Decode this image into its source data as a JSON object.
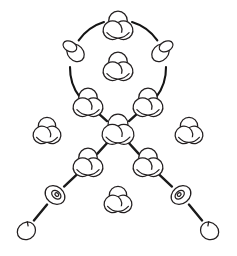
{
  "figure": {
    "background_color": "#ffffff",
    "stroke_color": "#231f20",
    "edge_color": "#1a1a1a",
    "width": 237,
    "height": 256
  },
  "legend": {
    "knot_types": [
      "trefoil",
      "twisted-loop",
      "coiled-loop",
      "unknot"
    ]
  },
  "chart_data": {
    "type": "diagram",
    "xlabel": "",
    "ylabel": "",
    "grid": false,
    "legend": "none",
    "xlim": [
      0,
      237
    ],
    "ylim": [
      0,
      256
    ],
    "nodes": [
      {
        "id": "n1",
        "label": "top",
        "knot": "trefoil",
        "x": 118,
        "y": 27,
        "r": 15,
        "on_circle": true,
        "angle_deg": 270
      },
      {
        "id": "n2",
        "label": "upper-right",
        "knot": "twisted-loop",
        "x": 163,
        "y": 50,
        "r": 14,
        "on_circle": true,
        "angle_deg": 342
      },
      {
        "id": "n3",
        "label": "upper-left",
        "knot": "twisted-loop",
        "x": 73,
        "y": 50,
        "r": 14,
        "on_circle": true,
        "angle_deg": 198
      },
      {
        "id": "n4",
        "label": "mid-left",
        "knot": "trefoil",
        "x": 88,
        "y": 104,
        "r": 15,
        "on_circle": true,
        "angle_deg": 126
      },
      {
        "id": "n5",
        "label": "mid-right",
        "knot": "trefoil",
        "x": 148,
        "y": 104,
        "r": 15,
        "on_circle": true,
        "angle_deg": 54
      },
      {
        "id": "n6",
        "label": "circle-center",
        "knot": "trefoil",
        "x": 118,
        "y": 68,
        "r": 15,
        "on_circle": false,
        "angle_deg": 0
      },
      {
        "id": "n7",
        "label": "hub",
        "knot": "trefoil",
        "x": 118,
        "y": 131,
        "r": 16,
        "on_circle": false,
        "angle_deg": 0
      },
      {
        "id": "n8",
        "label": "lower-left",
        "knot": "trefoil",
        "x": 88,
        "y": 164,
        "r": 15,
        "on_circle": false,
        "angle_deg": 0
      },
      {
        "id": "n9",
        "label": "lower-right",
        "knot": "trefoil",
        "x": 148,
        "y": 164,
        "r": 15,
        "on_circle": false,
        "angle_deg": 0
      },
      {
        "id": "n10",
        "label": "coil-left",
        "knot": "coiled-loop",
        "x": 55,
        "y": 195,
        "r": 13,
        "on_circle": false,
        "angle_deg": 0
      },
      {
        "id": "n11",
        "label": "coil-right",
        "knot": "coiled-loop",
        "x": 181,
        "y": 195,
        "r": 13,
        "on_circle": false,
        "angle_deg": 0
      },
      {
        "id": "n12",
        "label": "leaf-left",
        "knot": "unknot",
        "x": 26,
        "y": 230,
        "r": 13,
        "on_circle": false,
        "angle_deg": 0
      },
      {
        "id": "n13",
        "label": "leaf-right",
        "knot": "unknot",
        "x": 210,
        "y": 230,
        "r": 13,
        "on_circle": false,
        "angle_deg": 0
      }
    ],
    "free_nodes": [
      {
        "id": "f1",
        "label": "free-left",
        "knot": "trefoil",
        "x": 47,
        "y": 132,
        "r": 14
      },
      {
        "id": "f2",
        "label": "free-right",
        "knot": "trefoil",
        "x": 189,
        "y": 132,
        "r": 14
      },
      {
        "id": "f3",
        "label": "free-bottom",
        "knot": "trefoil",
        "x": 118,
        "y": 201,
        "r": 14
      }
    ],
    "circle_arcs": {
      "center_x": 118,
      "center_y": 68,
      "radius": 48,
      "gap_deg": 17,
      "segments": [
        {
          "from": "n3",
          "to": "n1"
        },
        {
          "from": "n1",
          "to": "n2"
        },
        {
          "from": "n2",
          "to": "n5"
        },
        {
          "from": "n4",
          "to": "n3"
        }
      ]
    },
    "edges": [
      {
        "from": "n4",
        "to": "n7",
        "style": "solid"
      },
      {
        "from": "n5",
        "to": "n7",
        "style": "solid"
      },
      {
        "from": "n7",
        "to": "n8",
        "style": "solid"
      },
      {
        "from": "n7",
        "to": "n9",
        "style": "solid"
      },
      {
        "from": "n8",
        "to": "n10",
        "style": "solid"
      },
      {
        "from": "n9",
        "to": "n11",
        "style": "solid"
      },
      {
        "from": "n10",
        "to": "n12",
        "style": "solid"
      },
      {
        "from": "n11",
        "to": "n13",
        "style": "solid"
      }
    ],
    "counts": {
      "total_knots": 16,
      "trefoils": 11,
      "twisted_loops": 2,
      "coiled_loops": 2,
      "unknots": 2,
      "edges": 8,
      "arcs": 4
    }
  }
}
